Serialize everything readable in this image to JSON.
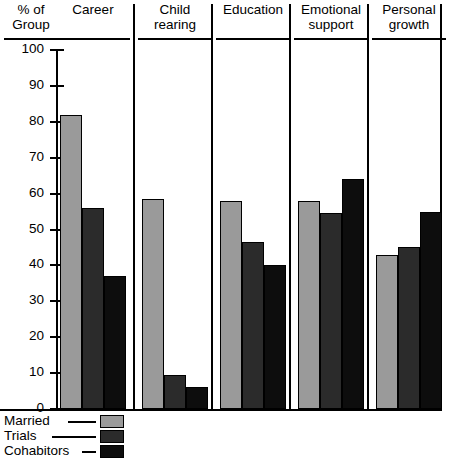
{
  "chart_data": {
    "type": "bar",
    "title": "",
    "xlabel": "",
    "ylabel": "% of Group",
    "ylim": [
      0,
      100
    ],
    "grid": false,
    "legend_position": "bottom-left",
    "categories": [
      "Career",
      "Child rearing",
      "Education",
      "Emotional support",
      "Personal growth"
    ],
    "yticks": [
      "0",
      "10",
      "20",
      "30",
      "40",
      "50",
      "60",
      "70",
      "80",
      "90",
      "100"
    ],
    "series": [
      {
        "name": "Married",
        "color": "#9a9a9a",
        "values": [
          82,
          58.5,
          58,
          58,
          43
        ]
      },
      {
        "name": "Trials",
        "color": "#2b2b2b",
        "values": [
          56,
          9.5,
          46.5,
          54.5,
          45
        ]
      },
      {
        "name": "Cohabitors",
        "color": "#0d0d0d",
        "values": [
          37,
          6,
          40,
          64,
          55
        ]
      }
    ]
  },
  "axis": {
    "title_line1": "% of",
    "title_line2": "Group"
  },
  "categories": [
    {
      "line1": "Career",
      "line2": ""
    },
    {
      "line1": "Child",
      "line2": "rearing"
    },
    {
      "line1": "Education",
      "line2": ""
    },
    {
      "line1": "Emotional",
      "line2": "support"
    },
    {
      "line1": "Personal",
      "line2": "growth"
    }
  ],
  "legend": [
    {
      "label": "Married",
      "color": "#9a9a9a"
    },
    {
      "label": "Trials",
      "color": "#2b2b2b"
    },
    {
      "label": "Cohabitors",
      "color": "#0d0d0d"
    }
  ]
}
